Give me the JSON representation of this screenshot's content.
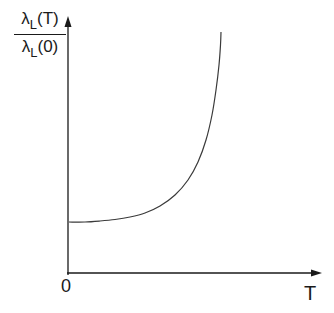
{
  "chart_data": {
    "type": "line",
    "title": "",
    "xlabel": "T",
    "ylabel": "λ_L(T) / λ_L(0)",
    "ylabel_parts": {
      "numerator_symbol": "λ",
      "numerator_sub": "L",
      "numerator_arg": "(T)",
      "denominator_symbol": "λ",
      "denominator_sub": "L",
      "denominator_arg": "(0)"
    },
    "origin_label": "0",
    "grid": false,
    "legend": null,
    "axis_ticks": {
      "x": [],
      "y": []
    },
    "series": [
      {
        "name": "λ_L(T)/λ_L(0)",
        "points_px": [
          [
            69,
            222
          ],
          [
            85,
            222
          ],
          [
            100,
            221
          ],
          [
            115,
            219.5
          ],
          [
            130,
            217
          ],
          [
            145,
            213
          ],
          [
            160,
            206
          ],
          [
            175,
            195
          ],
          [
            188,
            180
          ],
          [
            198,
            162
          ],
          [
            206,
            140
          ],
          [
            212,
            115
          ],
          [
            216,
            90
          ],
          [
            219,
            65
          ],
          [
            220.5,
            45
          ],
          [
            221,
            32
          ]
        ]
      }
    ],
    "axes_px": {
      "origin": [
        68,
        273
      ],
      "x_end": [
        321,
        273
      ],
      "y_end": [
        68,
        17
      ]
    },
    "colors": {
      "axis": "#1a1a1a",
      "curve": "#3a3a3a"
    }
  }
}
